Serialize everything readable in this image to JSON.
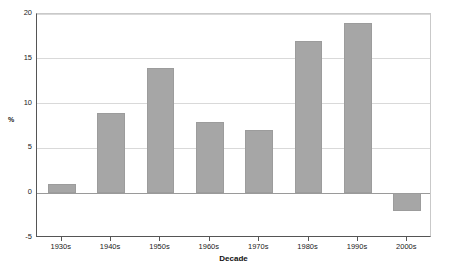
{
  "chart_data": {
    "type": "bar",
    "title": "",
    "subtitle": "",
    "xlabel": "Decade",
    "ylabel": "%",
    "categories": [
      "1930s",
      "1940s",
      "1950s",
      "1960s",
      "1970s",
      "1980s",
      "1990s",
      "2000s"
    ],
    "values": [
      1,
      9,
      14,
      8,
      7,
      17,
      19,
      -2
    ],
    "series": [
      {
        "name": "",
        "values": [
          1,
          9,
          14,
          8,
          7,
          17,
          19,
          -2
        ]
      }
    ],
    "ylim": [
      -5,
      20
    ],
    "yticks": [
      -5,
      0,
      5,
      10,
      15,
      20
    ],
    "ytick_labels": [
      "-5",
      "0",
      "5",
      "10",
      "15",
      "20"
    ],
    "grid": true,
    "grid_axis": "y",
    "legend": false,
    "legend_position": "none",
    "bar_color": "#a6a6a6",
    "bar_border_color": "#9c9c9c",
    "gridline_color": "#d9d9d9",
    "zero_line_color": "#9a9a9a",
    "axis_color": "#555555",
    "background_color": "#ffffff",
    "text_color": "#1a1a1a"
  }
}
